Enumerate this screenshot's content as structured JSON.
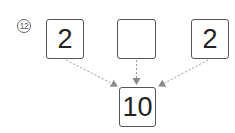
{
  "problem": {
    "number_label": "⑫",
    "number_text": "12"
  },
  "diagram": {
    "top_boxes": [
      {
        "value": "2"
      },
      {
        "value": ""
      },
      {
        "value": "2"
      }
    ],
    "result_box": {
      "value": "10"
    },
    "arrow_style": "dashed-gray",
    "colors": {
      "border": "#555555",
      "arrow": "#999999",
      "text": "#222222"
    }
  }
}
